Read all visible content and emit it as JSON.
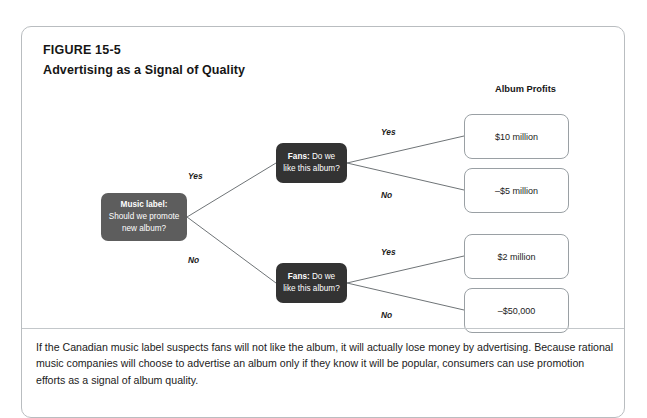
{
  "figure": {
    "number": "FIGURE 15-5",
    "title": "Advertising as a Signal of Quality"
  },
  "columns": {
    "album_profits_header": "Album Profits"
  },
  "nodes": {
    "music_label": {
      "lead": "Music label:",
      "text": "Should we promote new album?"
    },
    "fans_top": {
      "lead": "Fans:",
      "text": "Do we like this album?"
    },
    "fans_bottom": {
      "lead": "Fans:",
      "text": "Do we like this album?"
    }
  },
  "branches": {
    "label_yes": "Yes",
    "label_no": "No",
    "top_yes": "Yes",
    "top_no": "No",
    "bottom_yes": "Yes",
    "bottom_no": "No"
  },
  "outcomes": [
    {
      "value": "$10 million"
    },
    {
      "value": "–5 million",
      "display": "–$5 million"
    },
    {
      "value": "$2 million"
    },
    {
      "value": "–$50,000"
    }
  ],
  "outcome_values": {
    "o1": "$10 million",
    "o2": "–$5 million",
    "o3": "$2 million",
    "o4": "–$50,000"
  },
  "caption": {
    "text": "If the Canadian music label suspects fans will not like the album, it will actually lose money by advertising. Because rational music companies will choose to advertise an album only if they know it will be popular, consumers can use promotion efforts as a signal of album quality."
  },
  "colors": {
    "node_label_bg": "#5d5d5d",
    "node_fans_bg": "#333333",
    "frame_border": "#b9bdc0",
    "outcome_border": "#9aa0a4",
    "line": "#6f7477"
  }
}
